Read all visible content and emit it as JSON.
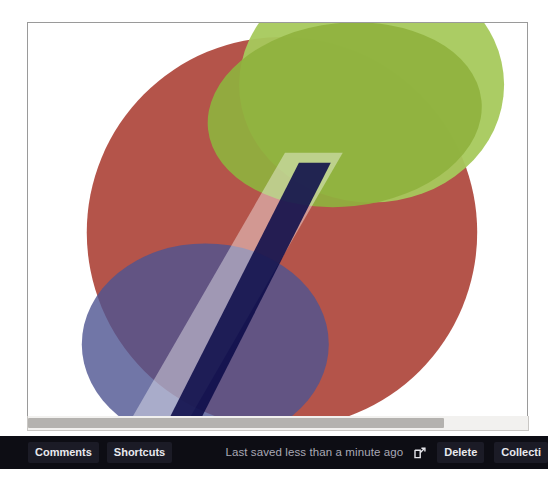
{
  "window": {
    "background": "#ffffff"
  },
  "canvas": {
    "name": "drawing-canvas",
    "background": "#ffffff",
    "border_color": "#9a9a9a",
    "shapes": [
      {
        "id": "red-ellipse",
        "kind": "ellipse",
        "label": "Large red ellipse",
        "color": "#b4544a",
        "cx": 255,
        "cy": 210,
        "rx": 195,
        "ry": 195
      },
      {
        "id": "green-ellipse-light",
        "kind": "ellipse",
        "label": "Light green ellipse",
        "color": "#a3c558",
        "cx": 340,
        "cy": 80,
        "rx": 130,
        "ry": 115
      },
      {
        "id": "green-ellipse-olive",
        "kind": "ellipse",
        "label": "Olive green ellipse",
        "color": "#8cb13d",
        "cx": 330,
        "cy": 100,
        "rx": 135,
        "ry": 95
      },
      {
        "id": "blue-ellipse",
        "kind": "ellipse",
        "label": "Slate blue ellipse",
        "color": "#5b6090",
        "cx": 180,
        "cy": 320,
        "rx": 122,
        "ry": 100
      },
      {
        "id": "salmon-band",
        "kind": "band",
        "label": "Wide translucent diagonal band",
        "color": "#ffffff",
        "opacity": 0.42,
        "width": 58
      },
      {
        "id": "navy-bar",
        "kind": "band",
        "label": "Dark navy diagonal bar",
        "color": "#0a0a4a",
        "opacity": 0.86,
        "width": 32
      }
    ]
  },
  "scrollbar": {
    "name": "horizontal-scrollbar",
    "orientation": "horizontal",
    "track_color": "#f2f1ef",
    "thumb_color": "#b4b2af",
    "thumb_start_pct": 0,
    "thumb_width_pct": 83
  },
  "bottom_bar": {
    "background": "#0d0d14",
    "left_buttons": [
      {
        "id": "comments",
        "label": "Comments"
      },
      {
        "id": "shortcuts",
        "label": "Shortcuts"
      }
    ],
    "status_text": "Last saved less than a minute ago",
    "external_link_icon": "external-link-icon",
    "right_buttons": [
      {
        "id": "delete",
        "label": "Delete"
      },
      {
        "id": "collections",
        "label": "Collecti"
      }
    ]
  }
}
